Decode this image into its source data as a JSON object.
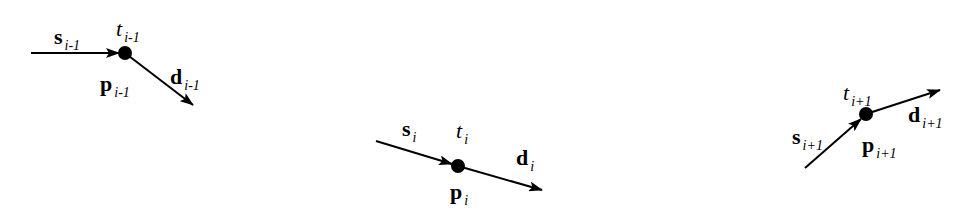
{
  "diagram": {
    "colors": {
      "stroke": "#000000",
      "background": "#ffffff"
    },
    "nodes": [
      {
        "id": "i-1",
        "point": {
          "x": 125,
          "y": 53
        },
        "incoming": {
          "from": [
            31,
            53
          ],
          "to": [
            119,
            53
          ]
        },
        "outgoing": {
          "from": [
            125,
            53
          ],
          "to": [
            193,
            105
          ]
        },
        "labels": {
          "s": {
            "main": "s",
            "sub": "i-1",
            "x": 54,
            "y": 26
          },
          "t": {
            "main": "t",
            "sub": "i-1",
            "x": 116,
            "y": 18
          },
          "p": {
            "main": "p",
            "sub": "i-1",
            "x": 100,
            "y": 73
          },
          "d": {
            "main": "d",
            "sub": "i-1",
            "x": 170,
            "y": 66
          }
        }
      },
      {
        "id": "i",
        "point": {
          "x": 458,
          "y": 166
        },
        "incoming": {
          "from": [
            376,
            141
          ],
          "to": [
            452,
            164
          ]
        },
        "outgoing": {
          "from": [
            458,
            166
          ],
          "to": [
            542,
            190
          ]
        },
        "labels": {
          "s": {
            "main": "s",
            "sub": "i",
            "x": 402,
            "y": 118
          },
          "t": {
            "main": "t",
            "sub": "i",
            "x": 456,
            "y": 120
          },
          "p": {
            "main": "p",
            "sub": "i",
            "x": 450,
            "y": 181
          },
          "d": {
            "main": "d",
            "sub": "i",
            "x": 516,
            "y": 147
          }
        }
      },
      {
        "id": "i+1",
        "point": {
          "x": 866,
          "y": 114
        },
        "incoming": {
          "from": [
            805,
            168
          ],
          "to": [
            861,
            119
          ]
        },
        "outgoing": {
          "from": [
            866,
            114
          ],
          "to": [
            940,
            90
          ]
        },
        "labels": {
          "s": {
            "main": "s",
            "sub": "i+1",
            "x": 792,
            "y": 126
          },
          "t": {
            "main": "t",
            "sub": "i+1",
            "x": 843,
            "y": 82
          },
          "p": {
            "main": "p",
            "sub": "i+1",
            "x": 862,
            "y": 134
          },
          "d": {
            "main": "d",
            "sub": "i+1",
            "x": 908,
            "y": 104
          }
        }
      }
    ]
  }
}
